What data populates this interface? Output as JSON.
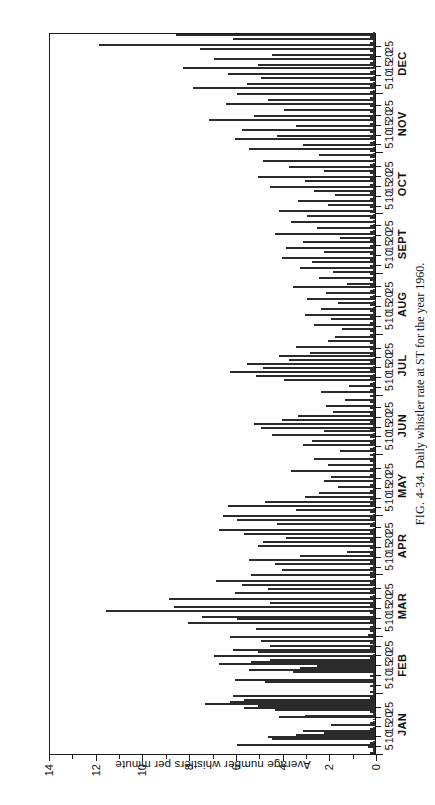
{
  "figure": {
    "caption_label": "FIG. 4-34.",
    "caption_text": "Daily whistler rate at ST for the year 1960."
  },
  "axes": {
    "y_axis_label": "Average number whistlers per minute",
    "y_ticks": [
      "0",
      "2",
      "4",
      "6",
      "8",
      "10",
      "12",
      "14"
    ],
    "x_day_ticks": [
      "5",
      "10",
      "15",
      "20",
      "25"
    ],
    "x_months": [
      "JAN",
      "FEB",
      "MAR",
      "APR",
      "MAY",
      "JUN",
      "JUL",
      "AUG",
      "SEPT",
      "OCT",
      "NOV",
      "DEC"
    ]
  },
  "colors": {
    "axis": "#1a1a1a",
    "bar_fill": "#d8d8d8",
    "bar_stroke": "#2b2b2b",
    "background": "#ffffff"
  },
  "chart_data": {
    "type": "bar",
    "title": "Daily whistler rate at ST for the year 1960",
    "xlabel": "",
    "ylabel": "Average number whistlers per minute",
    "ylim": [
      0,
      14
    ],
    "xlim": [
      1,
      366
    ],
    "grid": false,
    "legend": null,
    "orientation": "vertical-bars-rotated-90ccw",
    "x_unit": "day of year 1960",
    "months": [
      {
        "name": "JAN",
        "days": 31,
        "start_day": 1
      },
      {
        "name": "FEB",
        "days": 29,
        "start_day": 32
      },
      {
        "name": "MAR",
        "days": 31,
        "start_day": 61
      },
      {
        "name": "APR",
        "days": 30,
        "start_day": 92
      },
      {
        "name": "MAY",
        "days": 31,
        "start_day": 122
      },
      {
        "name": "JUN",
        "days": 30,
        "start_day": 153
      },
      {
        "name": "JUL",
        "days": 31,
        "start_day": 183
      },
      {
        "name": "AUG",
        "days": 31,
        "start_day": 214
      },
      {
        "name": "SEPT",
        "days": 30,
        "start_day": 245
      },
      {
        "name": "OCT",
        "days": 31,
        "start_day": 275
      },
      {
        "name": "NOV",
        "days": 30,
        "start_day": 306
      },
      {
        "name": "DEC",
        "days": 31,
        "start_day": 336
      }
    ],
    "values": [
      0.2,
      0.1,
      0.1,
      0.3,
      5.9,
      0.2,
      0.1,
      4.4,
      4.6,
      3.4,
      2.2,
      3.1,
      0.2,
      0.1,
      1.9,
      0.2,
      0.1,
      0.1,
      4.1,
      3.0,
      0.1,
      0.2,
      4.3,
      5.6,
      5.0,
      7.3,
      6.2,
      5.6,
      0.2,
      6.1,
      0.1,
      0.2,
      0.1,
      0.1,
      0.2,
      0.1,
      4.7,
      6.0,
      0.1,
      0.2,
      0.1,
      3.5,
      5.4,
      3.2,
      2.5,
      6.7,
      5.3,
      4.5,
      0.2,
      6.9,
      0.1,
      5.0,
      6.1,
      0.2,
      4.5,
      0.1,
      0.2,
      4.9,
      0.1,
      6.2,
      0.3,
      0.1,
      0.2,
      5.1,
      0.2,
      0.1,
      8.0,
      0.2,
      5.9,
      7.4,
      0.1,
      0.2,
      11.5,
      0.1,
      8.6,
      0.2,
      4.5,
      0.1,
      8.8,
      0.2,
      0.1,
      6.0,
      0.2,
      4.6,
      0.1,
      5.7,
      0.2,
      6.8,
      0.1,
      0.2,
      5.3,
      0.2,
      0.1,
      4.0,
      0.2,
      0.1,
      4.3,
      0.2,
      5.4,
      0.1,
      3.2,
      0.2,
      1.2,
      0.1,
      0.2,
      5.0,
      0.1,
      4.8,
      0.2,
      3.8,
      0.1,
      5.6,
      0.2,
      6.7,
      0.1,
      0.2,
      4.2,
      0.1,
      5.9,
      0.2,
      6.5,
      0.1,
      0.2,
      3.4,
      0.1,
      6.3,
      0.2,
      4.7,
      0.1,
      0.2,
      3.0,
      0.1,
      2.4,
      0.2,
      0.1,
      1.6,
      0.2,
      0.1,
      2.2,
      0.1,
      1.9,
      0.2,
      0.1,
      3.6,
      0.2,
      0.1,
      2.0,
      0.1,
      0.2,
      2.6,
      0.1,
      0.2,
      0.1,
      1.5,
      0.2,
      0.1,
      3.1,
      0.2,
      2.7,
      0.1,
      0.2,
      4.4,
      0.1,
      2.2,
      0.2,
      4.9,
      0.1,
      5.2,
      0.2,
      4.0,
      0.1,
      3.3,
      0.2,
      1.8,
      0.1,
      0.2,
      2.1,
      0.1,
      0.2,
      1.3,
      0.1,
      0.2,
      0.1,
      2.3,
      0.2,
      0.1,
      1.1,
      0.2,
      0.1,
      3.9,
      0.2,
      5.1,
      0.1,
      6.2,
      0.2,
      4.8,
      0.1,
      5.5,
      0.2,
      3.7,
      0.1,
      4.1,
      0.2,
      2.8,
      0.1,
      0.2,
      3.4,
      0.1,
      0.2,
      2.0,
      0.1,
      1.7,
      0.2,
      0.1,
      0.2,
      1.4,
      0.1,
      2.6,
      0.2,
      0.1,
      1.9,
      0.2,
      3.0,
      0.1,
      0.2,
      2.3,
      0.1,
      0.2,
      1.6,
      0.1,
      2.9,
      0.2,
      0.1,
      2.1,
      0.2,
      0.1,
      3.5,
      0.2,
      1.2,
      0.1,
      0.2,
      2.4,
      0.1,
      0.2,
      1.8,
      0.1,
      3.2,
      0.2,
      0.1,
      2.7,
      0.2,
      4.0,
      0.1,
      0.2,
      2.2,
      0.1,
      3.8,
      0.2,
      0.1,
      3.1,
      0.2,
      1.5,
      0.1,
      4.3,
      0.2,
      0.1,
      2.5,
      0.2,
      0.1,
      3.6,
      0.1,
      0.2,
      2.9,
      0.1,
      0.2,
      4.1,
      0.1,
      0.2,
      2.0,
      0.1,
      3.3,
      0.2,
      0.1,
      1.7,
      0.2,
      2.6,
      0.1,
      4.5,
      0.2,
      0.1,
      3.0,
      0.2,
      5.0,
      0.1,
      0.2,
      2.2,
      0.1,
      3.7,
      0.2,
      0.1,
      4.8,
      0.1,
      0.2,
      2.4,
      0.1,
      0.2,
      5.4,
      0.1,
      3.1,
      0.2,
      0.1,
      6.0,
      0.2,
      4.2,
      0.1,
      0.2,
      5.7,
      0.1,
      3.4,
      0.2,
      0.1,
      7.1,
      0.2,
      5.2,
      0.1,
      0.2,
      3.9,
      0.1,
      0.2,
      6.4,
      0.1,
      4.6,
      0.2,
      0.1,
      5.9,
      0.2,
      0.1,
      7.8,
      0.2,
      5.5,
      0.1,
      0.2,
      4.9,
      0.1,
      6.3,
      0.2,
      0.1,
      8.2,
      0.1,
      5.0,
      0.2,
      0.1,
      6.9,
      0.2,
      4.4,
      0.1,
      0.2,
      7.5,
      0.1,
      11.8,
      0.2,
      0.1,
      6.1,
      0.2,
      8.5,
      0.1
    ]
  }
}
